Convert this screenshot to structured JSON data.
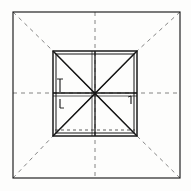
{
  "figure": {
    "title": "Perspective construction of a square frame",
    "type": "line-drawing",
    "canvas": {
      "width": 191,
      "height": 191,
      "background": "#fdfdfc"
    },
    "ink_color": "#1a1a1a",
    "construction_color": "#555555",
    "stroke_widths": {
      "heavy": 1.6,
      "medium": 1.0,
      "light": 0.7,
      "construction": 0.7
    },
    "outer_square": {
      "label": "outer frame",
      "x1": 13,
      "y1": 12,
      "x2": 180,
      "y2": 178,
      "stroke": "#1a1a1a",
      "stroke_width": 1.2
    },
    "inner_square": {
      "label": "inner frame",
      "x1": 53,
      "y1": 51,
      "x2": 137,
      "y2": 136,
      "stroke": "#1a1a1a",
      "stroke_width": 1.6,
      "inset_offset": 3
    },
    "center_point": {
      "x": 95,
      "y": 93
    },
    "axes": [
      {
        "name": "vertical-axis",
        "x1": 95,
        "y1": 12,
        "x2": 95,
        "y2": 178,
        "dash": "4,4"
      },
      {
        "name": "horizontal-axis",
        "x1": 13,
        "y1": 93,
        "x2": 180,
        "y2": 93,
        "dash": "4,4"
      }
    ],
    "corner_rays": [
      {
        "name": "ray-top-left",
        "x1": 13,
        "y1": 12,
        "x2": 53,
        "y2": 51,
        "dash": "4,4"
      },
      {
        "name": "ray-top-right",
        "x1": 180,
        "y1": 12,
        "x2": 137,
        "y2": 51,
        "dash": "4,4"
      },
      {
        "name": "ray-bottom-left",
        "x1": 13,
        "y1": 178,
        "x2": 53,
        "y2": 136,
        "dash": "4,4"
      },
      {
        "name": "ray-bottom-right",
        "x1": 180,
        "y1": 178,
        "x2": 137,
        "y2": 136,
        "dash": "4,4"
      }
    ],
    "inner_diagonals": [
      {
        "name": "diagonal-tl-br",
        "x1": 53,
        "y1": 51,
        "x2": 137,
        "y2": 136
      },
      {
        "name": "diagonal-tr-bl",
        "x1": 137,
        "y1": 51,
        "x2": 53,
        "y2": 136
      }
    ],
    "inner_cross": [
      {
        "name": "mullion-vertical",
        "x1": 95,
        "y1": 51,
        "x2": 95,
        "y2": 136
      },
      {
        "name": "mullion-horizontal",
        "x1": 53,
        "y1": 93,
        "x2": 137,
        "y2": 93
      }
    ],
    "dashed_inner_bottom": {
      "name": "hidden-bottom-edge",
      "x1": 55,
      "y1": 130,
      "x2": 135,
      "y2": 130,
      "dash": "3,3"
    },
    "hardware_marks": [
      {
        "name": "handle-upper-left",
        "x": 60,
        "y1": 79,
        "y2": 92,
        "cap_top": true
      },
      {
        "name": "handle-lower-left",
        "x": 60,
        "y1": 96,
        "y2": 108,
        "hook": true
      },
      {
        "name": "latch-right",
        "x": 131,
        "y1": 96,
        "y2": 104,
        "hook": true
      }
    ],
    "legend": []
  }
}
